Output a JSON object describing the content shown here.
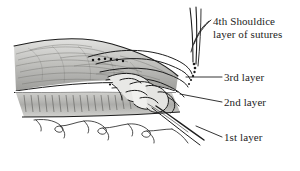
{
  "figure": {
    "background_color": "#ffffff",
    "ink_color": "#1d1d1d",
    "tissue_gray_light": "#d8d8d6",
    "tissue_gray_mid": "#b3b3b0",
    "tissue_gray_dark": "#8c8c89"
  },
  "labels": {
    "fourth_line1": "4th Shouldice",
    "fourth_line2": "layer of sutures",
    "third": "3rd layer",
    "second": "2nd layer",
    "first": "1st layer"
  },
  "structures": {
    "upper_band": "aponeurosis-muscle-wedge",
    "lower_band": "muscle-fiber-band",
    "bottom_tissue": "loose-connective-tissue",
    "knot_region": "overlapped-suture-knot",
    "suture_strands": "free-suture-ends"
  }
}
